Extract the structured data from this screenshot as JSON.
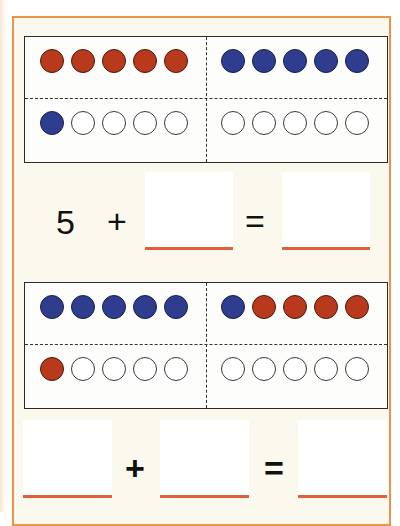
{
  "colors": {
    "frame_border": "#e8954a",
    "background": "#fbf8ee",
    "red_counter": "#b8391c",
    "blue_counter": "#2f3d8e",
    "underline": "#e0603a"
  },
  "exercises": [
    {
      "ten_frame": {
        "top_left": [
          "red",
          "red",
          "red",
          "red",
          "red"
        ],
        "top_right": [
          "blue",
          "blue",
          "blue",
          "blue",
          "blue"
        ],
        "bottom_left": [
          "blue",
          "empty",
          "empty",
          "empty",
          "empty"
        ],
        "bottom_right": [
          "empty",
          "empty",
          "empty",
          "empty",
          "empty"
        ]
      },
      "equation": {
        "first_addend": "5",
        "plus": "+",
        "second_addend": "",
        "equals": "=",
        "sum": ""
      }
    },
    {
      "ten_frame": {
        "top_left": [
          "blue",
          "blue",
          "blue",
          "blue",
          "blue"
        ],
        "top_right": [
          "blue",
          "red",
          "red",
          "red",
          "red"
        ],
        "bottom_left": [
          "red",
          "empty",
          "empty",
          "empty",
          "empty"
        ],
        "bottom_right": [
          "empty",
          "empty",
          "empty",
          "empty",
          "empty"
        ]
      },
      "equation": {
        "first_addend": "",
        "plus": "+",
        "second_addend": "",
        "equals": "=",
        "sum": ""
      }
    }
  ]
}
